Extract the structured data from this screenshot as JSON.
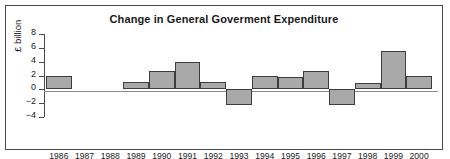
{
  "chart_data": {
    "type": "bar",
    "title": "Change in General Goverment Expenditure",
    "xlabel": "",
    "ylabel": "£ billion",
    "categories": [
      "1986",
      "1987",
      "1988",
      "1989",
      "1990",
      "1991",
      "1992",
      "1993",
      "1994",
      "1995",
      "1996",
      "1997",
      "1998",
      "1999",
      "2000"
    ],
    "values": [
      2.0,
      0,
      0,
      1.0,
      2.7,
      3.9,
      1.0,
      -2.2,
      1.9,
      1.8,
      2.6,
      -2.3,
      0.9,
      5.6,
      2.0
    ],
    "ylim": [
      -4,
      8
    ],
    "yticks": [
      8,
      6,
      4,
      2,
      0,
      -2,
      -4
    ],
    "ytick_labels": [
      "8",
      "6",
      "4",
      "2",
      "0",
      "−2",
      "−4"
    ],
    "grid": false,
    "legend": null,
    "bar_fill_color": "#a9a9a9",
    "bar_edge_color": "#3d3d3d",
    "frame_color": "#4a4a4a",
    "text_color": "#1a1a1a"
  }
}
